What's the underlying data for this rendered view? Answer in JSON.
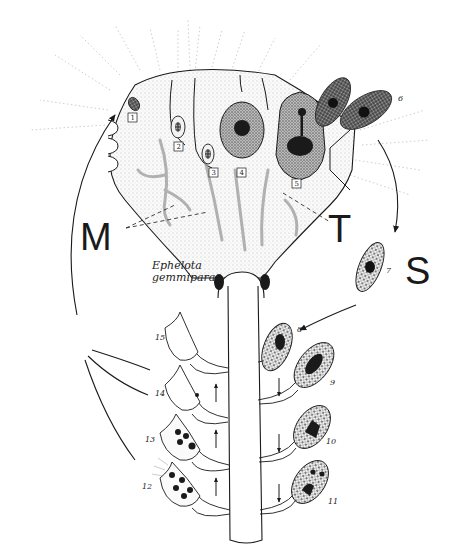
{
  "figure": {
    "species_label_line1": "Ephelota",
    "species_label_line2": "gemmipara",
    "labels": {
      "M": "M",
      "T": "T",
      "S": "S"
    },
    "boxed_stage_numbers": [
      "1",
      "2",
      "3",
      "4",
      "5"
    ],
    "stage_numbers": {
      "s6": "6",
      "s7": "7",
      "s8": "8",
      "s9": "9",
      "s10": "10",
      "s11": "11",
      "s12": "12",
      "s13": "13",
      "s14": "14",
      "s15": "15"
    },
    "colors": {
      "ink": "#1a1a1a",
      "stipple": "#9a9a9a",
      "dark_cell": "#3a3a3a",
      "background": "#ffffff"
    }
  }
}
